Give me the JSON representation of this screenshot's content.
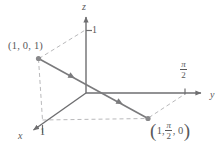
{
  "figure": {
    "type": "math-diagram",
    "colors": {
      "axis": "#6e6e70",
      "curve": "#7a7a7c",
      "dashed": "#b9b9bb",
      "text": "#58585a",
      "background": "#ffffff"
    },
    "axes": [
      {
        "name": "x",
        "label": "x",
        "tick_label": "1"
      },
      {
        "name": "y",
        "label": "y",
        "tick_label_numerator": "π",
        "tick_label_denominator": "2"
      },
      {
        "name": "z",
        "label": "z",
        "tick_label": "1"
      }
    ],
    "points": [
      {
        "id": "point-a",
        "label": "(1, 0, 1)",
        "coords": [
          1,
          0,
          1
        ]
      },
      {
        "id": "point-b",
        "label_open_paren": "(",
        "label_first": "1,",
        "label_frac_num": "π",
        "label_frac_den": "2",
        "label_last": ", 0",
        "label_close_paren": ")",
        "coords": [
          1,
          1.5707963,
          0
        ]
      }
    ],
    "curve": {
      "name": "space-curve",
      "direction": "from (1, 0, 1) through origin to (1, pi/2, 0)",
      "arrowheads": 3
    }
  }
}
